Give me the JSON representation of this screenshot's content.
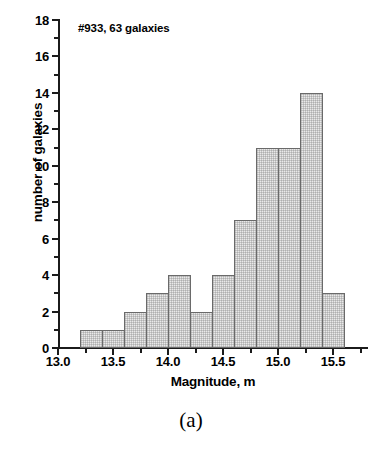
{
  "figure": {
    "annotation": "#933, 63 galaxies",
    "panel_caption": "(a)",
    "bar_fill": "#e9e9e9",
    "bar_edge": "#6a6a6a",
    "axis_color": "#1b1b1b"
  },
  "chart_data": {
    "type": "bar",
    "title": "",
    "annotation": "#933, 63 galaxies",
    "xlabel": "Magnitude, m",
    "ylabel": "number of galaxies",
    "xlim": [
      13.0,
      15.8
    ],
    "ylim": [
      0,
      18
    ],
    "grid": false,
    "legend": null,
    "bin_width": 0.2,
    "bin_edges": [
      13.2,
      13.4,
      13.6,
      13.8,
      14.0,
      14.2,
      14.4,
      14.6,
      14.8,
      15.0,
      15.2,
      15.4,
      15.6
    ],
    "bin_centers": [
      13.3,
      13.5,
      13.7,
      13.9,
      14.1,
      14.3,
      14.5,
      14.7,
      14.9,
      15.1,
      15.3,
      15.5
    ],
    "values": [
      1,
      1,
      2,
      3,
      4,
      2,
      4,
      7,
      11,
      11,
      14,
      3
    ],
    "total_count": 63,
    "x_ticks_major": [
      13.0,
      13.5,
      14.0,
      14.5,
      15.0,
      15.5
    ],
    "x_tick_labels": [
      "13.0",
      "13.5",
      "14.0",
      "14.5",
      "15.0",
      "15.5"
    ],
    "x_ticks_minor": [
      13.25,
      13.75,
      14.25,
      14.75,
      15.25,
      15.75
    ],
    "y_ticks_major": [
      0,
      2,
      4,
      6,
      8,
      10,
      12,
      14,
      16,
      18
    ],
    "y_tick_labels": [
      "0",
      "2",
      "4",
      "6",
      "8",
      "10",
      "12",
      "14",
      "16",
      "18"
    ],
    "y_ticks_minor": [
      1,
      3,
      5,
      7,
      9,
      11,
      13,
      15,
      17
    ]
  }
}
